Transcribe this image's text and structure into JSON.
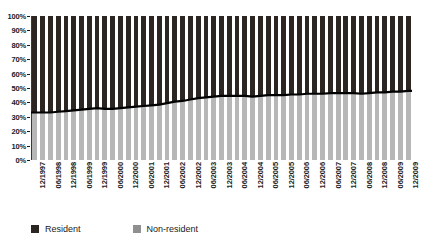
{
  "chart_data": {
    "type": "bar",
    "title": "",
    "subtitle": "",
    "xlabel": "",
    "ylabel": "",
    "stacked": true,
    "stack_mode": "percent",
    "grid": false,
    "legend_position": "bottom",
    "ylim": [
      0,
      100
    ],
    "y_ticks": [
      "0%",
      "10%",
      "20%",
      "30%",
      "40%",
      "50%",
      "60%",
      "70%",
      "80%",
      "90%",
      "100%"
    ],
    "y_tick_values": [
      0,
      10,
      20,
      30,
      40,
      50,
      60,
      70,
      80,
      90,
      100
    ],
    "categories": [
      "12/1997",
      "03/1998",
      "06/1998",
      "09/1998",
      "12/1998",
      "03/1999",
      "06/1999",
      "09/1999",
      "12/1999",
      "03/2000",
      "06/2000",
      "09/2000",
      "12/2000",
      "03/2001",
      "06/2001",
      "09/2001",
      "12/2001",
      "03/2002",
      "06/2002",
      "09/2002",
      "12/2002",
      "03/2003",
      "06/2003",
      "09/2003",
      "12/2003",
      "03/2004",
      "06/2004",
      "09/2004",
      "12/2004",
      "03/2005",
      "06/2005",
      "09/2005",
      "12/2005",
      "03/2006",
      "06/2006",
      "09/2006",
      "12/2006",
      "03/2007",
      "06/2007",
      "09/2007",
      "12/2007",
      "03/2008",
      "06/2008",
      "09/2008",
      "12/2008",
      "03/2009",
      "06/2009",
      "09/2009",
      "12/2009"
    ],
    "x_tick_labels": [
      "12/1997",
      "06/1998",
      "12/1998",
      "06/1999",
      "12/1999",
      "06/2000",
      "12/2000",
      "06/2001",
      "12/2001",
      "06/2002",
      "12/2002",
      "06/2003",
      "12/2003",
      "06/2004",
      "12/2004",
      "06/2005",
      "12/2005",
      "06/2006",
      "12/2006",
      "06/2007",
      "12/2007",
      "06/2008",
      "12/2008",
      "06/2009",
      "12/2009"
    ],
    "series": [
      {
        "name": "Non-resident",
        "color": "#b7b7b7",
        "values": [
          33,
          33,
          33,
          33.5,
          34,
          34.5,
          35,
          35.5,
          36,
          35.5,
          35.5,
          36,
          36.5,
          37,
          37.5,
          38,
          38.5,
          39.5,
          40.5,
          41,
          42,
          43,
          43.5,
          44,
          44.5,
          44.5,
          44.5,
          44.5,
          44,
          44.5,
          45,
          45,
          45,
          45.5,
          45.5,
          46,
          46,
          46,
          46.5,
          46.5,
          46.5,
          46.5,
          46,
          46.5,
          47,
          47,
          47.5,
          47.5,
          48
        ]
      },
      {
        "name": "Resident",
        "color": "#2b2622",
        "values": [
          67,
          67,
          67,
          66.5,
          66,
          65.5,
          65,
          64.5,
          64,
          64.5,
          64.5,
          64,
          63.5,
          63,
          62.5,
          62,
          61.5,
          60.5,
          59.5,
          59,
          58,
          57,
          56.5,
          56,
          55.5,
          55.5,
          55.5,
          55.5,
          56,
          55.5,
          55,
          55,
          55,
          54.5,
          54.5,
          54,
          54,
          54,
          53.5,
          53.5,
          53.5,
          53.5,
          54,
          53.5,
          53,
          53,
          52.5,
          52.5,
          52
        ]
      }
    ],
    "boundary_line": {
      "name": "Non-resident share boundary",
      "color": "#000000",
      "values": [
        33,
        33,
        33,
        33.5,
        34,
        34.5,
        35,
        35.5,
        36,
        35.5,
        35.5,
        36,
        36.5,
        37,
        37.5,
        38,
        38.5,
        39.5,
        40.5,
        41,
        42,
        43,
        43.5,
        44,
        44.5,
        44.5,
        44.5,
        44.5,
        44,
        44.5,
        45,
        45,
        45,
        45.5,
        45.5,
        46,
        46,
        46,
        46.5,
        46.5,
        46.5,
        46.5,
        46,
        46.5,
        47,
        47,
        47.5,
        47.5,
        48
      ]
    }
  },
  "legend": {
    "items": [
      {
        "label": "Resident",
        "color": "#2b2622",
        "swatch": "resident-swatch"
      },
      {
        "label": "Non-resident",
        "color": "#8f8f8f",
        "swatch": "nonresident-swatch"
      }
    ]
  }
}
